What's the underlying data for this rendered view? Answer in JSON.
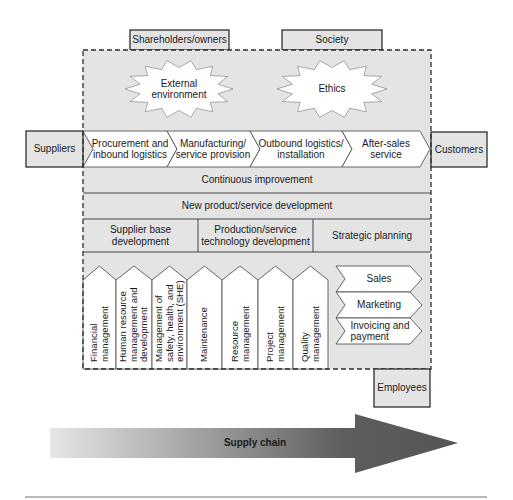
{
  "stakeholders_top": [
    {
      "label": "Shareholders/owners"
    },
    {
      "label": "Society"
    }
  ],
  "influences": [
    {
      "lines": [
        "External",
        "environment"
      ]
    },
    {
      "lines": [
        "Ethics"
      ]
    }
  ],
  "suppliers": {
    "label": "Suppliers"
  },
  "customers": {
    "label": "Customers"
  },
  "primary_processes": [
    {
      "lines": [
        "Procurement and",
        "inbound logistics"
      ]
    },
    {
      "lines": [
        "Manufacturing/",
        "service provision"
      ]
    },
    {
      "lines": [
        "Outbound logistics/",
        "installation"
      ]
    },
    {
      "lines": [
        "After-sales",
        "service"
      ]
    }
  ],
  "horizontal_processes": [
    {
      "label": "Continuous improvement"
    },
    {
      "label": "New product/service development"
    }
  ],
  "development_processes": [
    {
      "lines": [
        "Supplier base",
        "development"
      ]
    },
    {
      "lines": [
        "Production/service",
        "technology development"
      ]
    },
    {
      "lines": [
        "Strategic planning"
      ]
    }
  ],
  "support_processes": [
    {
      "lines": [
        "Financial",
        "management"
      ]
    },
    {
      "lines": [
        "Human resource",
        "management and",
        "development"
      ]
    },
    {
      "lines": [
        "Management of",
        "safety, health, and",
        "environment (SHE)"
      ]
    },
    {
      "lines": [
        "Maintenance"
      ]
    },
    {
      "lines": [
        "Resource",
        "management"
      ]
    },
    {
      "lines": [
        "Project",
        "management"
      ]
    },
    {
      "lines": [
        "Quality",
        "management"
      ]
    }
  ],
  "customer_processes": [
    {
      "lines": [
        "Sales"
      ]
    },
    {
      "lines": [
        "Marketing"
      ]
    },
    {
      "lines": [
        "Invoicing and",
        "payment"
      ]
    }
  ],
  "employees": {
    "label": "Employees"
  },
  "supply_chain_arrow": {
    "label": "Supply chain"
  },
  "colors": {
    "panel_fill": "#e4e4e4",
    "box_stroke": "#2e2e2e",
    "shape_fill": "#ffffff",
    "arrow_start": "#e6e6e6",
    "arrow_end": "#555555"
  }
}
